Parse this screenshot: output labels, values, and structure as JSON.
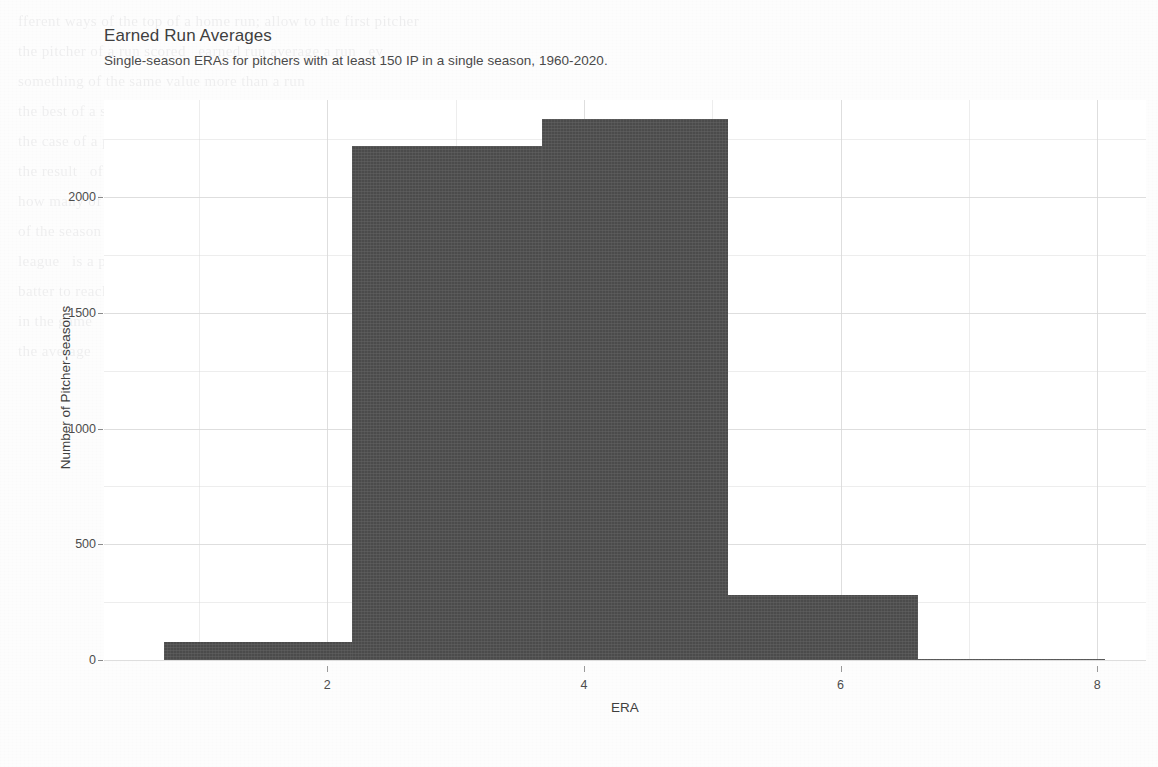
{
  "chart_data": {
    "type": "bar",
    "title": "Earned Run Averages",
    "subtitle": "Single-season ERAs for pitchers with at least 150 IP in a single season, 1960-2020.",
    "xlabel": "ERA",
    "ylabel": "Number of Pitcher-seasons",
    "xlim": [
      0.26,
      8.38
    ],
    "ylim": [
      0,
      2420
    ],
    "grid": true,
    "legend": "none",
    "bin_width": 1.46,
    "bin_edges": [
      0.73,
      2.19,
      3.67,
      5.12,
      6.6,
      8.06
    ],
    "bin_midpoints": [
      1.46,
      2.93,
      4.39,
      5.86,
      7.33
    ],
    "values": [
      78,
      2220,
      2337,
      282,
      3
    ],
    "categories": [
      "0.73-2.19",
      "2.19-3.67",
      "3.67-5.12",
      "5.12-6.60",
      "6.60-8.06"
    ],
    "xticks": [
      2,
      4,
      6,
      8
    ],
    "xtick_labels": [
      "2",
      "4",
      "6",
      "8"
    ],
    "yticks": [
      0,
      500,
      1000,
      1500,
      2000
    ],
    "ytick_labels": [
      "0",
      "500",
      "1000",
      "1500",
      "2000"
    ],
    "yticks_minor": [
      250,
      750,
      1250,
      1750,
      2250
    ],
    "xticks_minor": [
      1,
      3,
      5,
      7
    ],
    "bar_color": "#4b4b4b",
    "grid_color": "#d8d8d8",
    "panel_background": "#ffffff",
    "text_color": "#4d4d4d"
  },
  "ghost_text": "fferent ways of the top of a home run; allow to the first pitcher\nthe pitcher of a run scored   earned run average a run   ev\nsomething of the same value more than a run\nthe best of a single pitcher in a run of a run\nthe case of a pitching   of a batter in the field of play\nthe result   of the run   of a team that scores\nhow many of these are in the range of a value\nof the season   and the pitcher   of the year and the\nleague   is a pitcher with a run that allows the\nbatter to reach   and the run of a season\nin the game   of the season of a pitcher\nthe average   of a run   of the pitcher"
}
